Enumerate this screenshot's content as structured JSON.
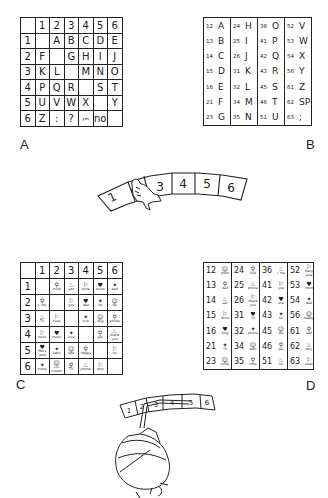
{
  "panels": {
    "A": {
      "label": "A",
      "col_headers": [
        "",
        "1",
        "2",
        "3",
        "4",
        "5",
        "6"
      ],
      "rows": [
        {
          "row": "1",
          "cells": [
            "",
            "A",
            "B",
            "C",
            "D",
            "E"
          ]
        },
        {
          "row": "2",
          "cells": [
            "F",
            "",
            "G",
            "H",
            "I",
            "J"
          ]
        },
        {
          "row": "3",
          "cells": [
            "K",
            "L",
            "",
            "M",
            "N",
            "O"
          ]
        },
        {
          "row": "4",
          "cells": [
            "P",
            "Q",
            "R",
            "",
            "S",
            "T"
          ]
        },
        {
          "row": "5",
          "cells": [
            "U",
            "V",
            "W",
            "X",
            "",
            "Y"
          ]
        },
        {
          "row": "6",
          "cells": [
            "Z",
            ":",
            "?",
            "yes",
            "no",
            ""
          ]
        }
      ]
    },
    "B": {
      "label": "B",
      "columns": [
        [
          {
            "code": "12",
            "val": "A"
          },
          {
            "code": "13",
            "val": "B"
          },
          {
            "code": "14",
            "val": "C"
          },
          {
            "code": "15",
            "val": "D"
          },
          {
            "code": "16",
            "val": "E"
          },
          {
            "code": "21",
            "val": "F"
          },
          {
            "code": "23",
            "val": "G"
          }
        ],
        [
          {
            "code": "24",
            "val": "H"
          },
          {
            "code": "25",
            "val": "I"
          },
          {
            "code": "26",
            "val": "J"
          },
          {
            "code": "31",
            "val": "K"
          },
          {
            "code": "32",
            "val": "L"
          },
          {
            "code": "34",
            "val": "M"
          },
          {
            "code": "35",
            "val": "N"
          }
        ],
        [
          {
            "code": "36",
            "val": "O"
          },
          {
            "code": "41",
            "val": "P"
          },
          {
            "code": "42",
            "val": "Q"
          },
          {
            "code": "43",
            "val": "R"
          },
          {
            "code": "45",
            "val": "S"
          },
          {
            "code": "46",
            "val": "T"
          },
          {
            "code": "51",
            "val": "U"
          }
        ],
        [
          {
            "code": "52",
            "val": "V"
          },
          {
            "code": "53",
            "val": "W"
          },
          {
            "code": "54",
            "val": "X"
          },
          {
            "code": "56",
            "val": "Y"
          },
          {
            "code": "61",
            "val": "Z"
          },
          {
            "code": "62",
            "val": "SP"
          },
          {
            "code": "63",
            "val": ";"
          }
        ]
      ]
    },
    "arc_top": {
      "keys": [
        "1",
        "2",
        "3",
        "4",
        "5",
        "6"
      ],
      "pointer": "hand"
    },
    "C": {
      "label": "C",
      "col_headers": [
        "",
        "1",
        "2",
        "3",
        "4",
        "5",
        "6"
      ],
      "rows": [
        {
          "row": "1",
          "cells": [
            "",
            "mom",
            "eat",
            "drink",
            "toilet",
            "bed"
          ]
        },
        {
          "row": "2",
          "cells": [
            "I, me",
            "",
            "you",
            "dad",
            "he",
            "we"
          ]
        },
        {
          "row": "3",
          "cells": [
            "TV",
            "food",
            "",
            "sick",
            "dog",
            "phone"
          ]
        },
        {
          "row": "4",
          "cells": [
            "hello",
            "music",
            "love",
            "",
            "yes",
            "thank you"
          ]
        },
        {
          "row": "5",
          "cells": [
            "Mary Jane",
            "bath",
            "sad",
            "happy",
            "",
            "no"
          ]
        },
        {
          "row": "6",
          "cells": [
            "home",
            "ice cream",
            "TV",
            "phone",
            "why",
            ""
          ]
        }
      ]
    },
    "D": {
      "label": "D",
      "columns": [
        [
          {
            "code": "12",
            "val": "mom"
          },
          {
            "code": "13",
            "val": "dad"
          },
          {
            "code": "14",
            "val": "eat"
          },
          {
            "code": "15",
            "val": "drink"
          },
          {
            "code": "16",
            "val": "sing"
          },
          {
            "code": "21",
            "val": "TV"
          },
          {
            "code": "23",
            "val": "toilet"
          }
        ],
        [
          {
            "code": "24",
            "val": "sick"
          },
          {
            "code": "25",
            "val": "phone"
          },
          {
            "code": "26",
            "val": "thank you"
          },
          {
            "code": "31",
            "val": "TV"
          },
          {
            "code": "32",
            "val": "phone"
          },
          {
            "code": "34",
            "val": "bath"
          },
          {
            "code": "35",
            "val": "time"
          }
        ],
        [
          {
            "code": "36",
            "val": "I, me"
          },
          {
            "code": "41",
            "val": "you"
          },
          {
            "code": "42",
            "val": "she"
          },
          {
            "code": "43",
            "val": "he"
          },
          {
            "code": "45",
            "val": "we"
          },
          {
            "code": "46",
            "val": "yes"
          },
          {
            "code": "51",
            "val": "no"
          }
        ],
        [
          {
            "code": "52",
            "val": "Mary Jane"
          },
          {
            "code": "53",
            "val": "mom"
          },
          {
            "code": "54",
            "val": "dad"
          },
          {
            "code": "56",
            "val": "happy"
          },
          {
            "code": "61",
            "val": "sad"
          },
          {
            "code": "62",
            "val": "why"
          },
          {
            "code": "63",
            "val": "later"
          }
        ]
      ]
    },
    "arc_bottom": {
      "keys": [
        "1",
        "2",
        "3",
        "4",
        "5",
        "6"
      ],
      "pointer": "head-pointer"
    }
  }
}
